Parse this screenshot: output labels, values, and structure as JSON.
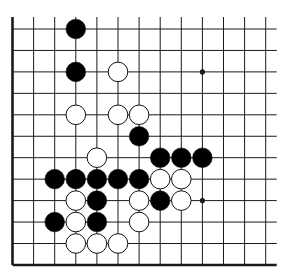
{
  "diagram": {
    "type": "go-board-fragment",
    "visible_columns": 13,
    "visible_rows": 12,
    "edges": [
      "left",
      "bottom"
    ],
    "colors": {
      "line": "#1a1a1a",
      "black_stone": "#000000",
      "white_stone": "#ffffff",
      "background": "#ffffff"
    },
    "star_points": [
      {
        "col": 9,
        "row": 2
      },
      {
        "col": 9,
        "row": 8
      }
    ],
    "stones": [
      {
        "color": "black",
        "col": 3,
        "row": 0
      },
      {
        "color": "black",
        "col": 3,
        "row": 2
      },
      {
        "color": "white",
        "col": 5,
        "row": 2
      },
      {
        "color": "white",
        "col": 3,
        "row": 4
      },
      {
        "color": "white",
        "col": 5,
        "row": 4
      },
      {
        "color": "white",
        "col": 6,
        "row": 4
      },
      {
        "color": "black",
        "col": 6,
        "row": 5
      },
      {
        "color": "white",
        "col": 4,
        "row": 6
      },
      {
        "color": "black",
        "col": 7,
        "row": 6
      },
      {
        "color": "black",
        "col": 8,
        "row": 6
      },
      {
        "color": "black",
        "col": 9,
        "row": 6
      },
      {
        "color": "black",
        "col": 2,
        "row": 7
      },
      {
        "color": "black",
        "col": 3,
        "row": 7
      },
      {
        "color": "black",
        "col": 4,
        "row": 7
      },
      {
        "color": "black",
        "col": 5,
        "row": 7
      },
      {
        "color": "black",
        "col": 6,
        "row": 7
      },
      {
        "color": "white",
        "col": 7,
        "row": 7
      },
      {
        "color": "white",
        "col": 8,
        "row": 7
      },
      {
        "color": "white",
        "col": 3,
        "row": 8
      },
      {
        "color": "black",
        "col": 4,
        "row": 8
      },
      {
        "color": "white",
        "col": 6,
        "row": 8
      },
      {
        "color": "black",
        "col": 7,
        "row": 8
      },
      {
        "color": "white",
        "col": 8,
        "row": 8
      },
      {
        "color": "black",
        "col": 2,
        "row": 9
      },
      {
        "color": "white",
        "col": 3,
        "row": 9
      },
      {
        "color": "black",
        "col": 4,
        "row": 9
      },
      {
        "color": "white",
        "col": 6,
        "row": 9
      },
      {
        "color": "white",
        "col": 3,
        "row": 10
      },
      {
        "color": "white",
        "col": 4,
        "row": 10
      },
      {
        "color": "white",
        "col": 5,
        "row": 10
      }
    ]
  }
}
